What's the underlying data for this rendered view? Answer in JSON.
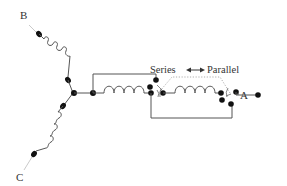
{
  "diagram": {
    "type": "three-phase series/parallel coil switching schematic",
    "terminals": {
      "a": "A",
      "b": "B",
      "c": "C"
    },
    "switch_modes": {
      "series": "Series",
      "arrow": "←→",
      "parallel": "Parallel"
    },
    "colors": {
      "wire": "#555555",
      "node": "#111111",
      "text": "#333333",
      "background": "#ffffff"
    },
    "phases": [
      {
        "name": "B",
        "coils": 1,
        "direction": "upper-left"
      },
      {
        "name": "C",
        "coils": 1,
        "direction": "lower-left"
      },
      {
        "name": "A",
        "coils": 2,
        "direction": "right",
        "switchable": true
      }
    ]
  }
}
